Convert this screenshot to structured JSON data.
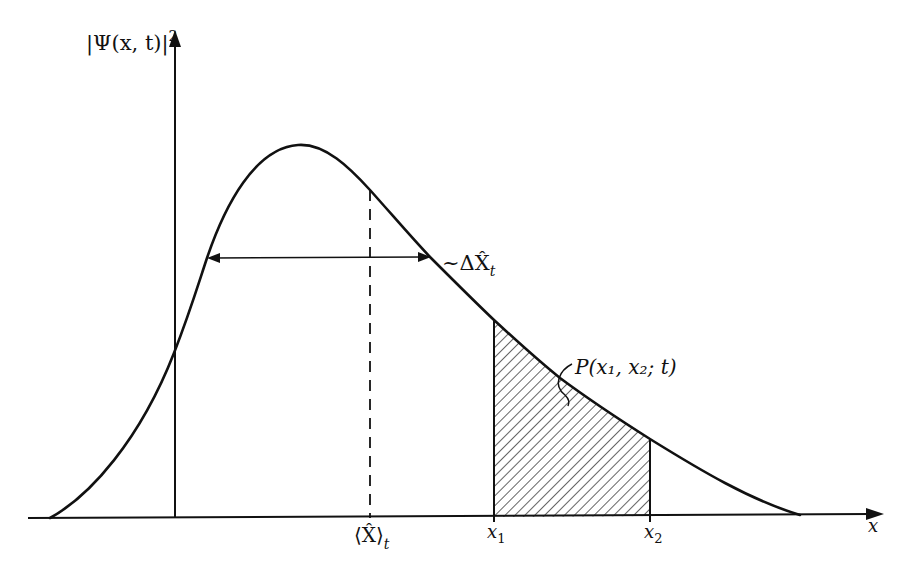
{
  "diagram": {
    "type": "probability-density-plot",
    "colors": {
      "ink": "#111111",
      "background": "#ffffff"
    },
    "y_axis": {
      "label_main": "|Ψ(x, t)|",
      "label_sup": "2"
    },
    "x_axis": {
      "label": "x"
    },
    "curve": {
      "description": "Skewed bell-shaped probability density with peak left of center and long right tail"
    },
    "width_annotation": {
      "prefix": "~Δ",
      "symbol": "X̂",
      "subscript": "t"
    },
    "mean_marker": {
      "symbol": "⟨X̂⟩",
      "subscript": "t"
    },
    "interval": {
      "x1_label": "x",
      "x1_sub": "1",
      "x2_label": "x",
      "x2_sub": "2",
      "region_label": "P(x₁, x₂; t)"
    }
  }
}
